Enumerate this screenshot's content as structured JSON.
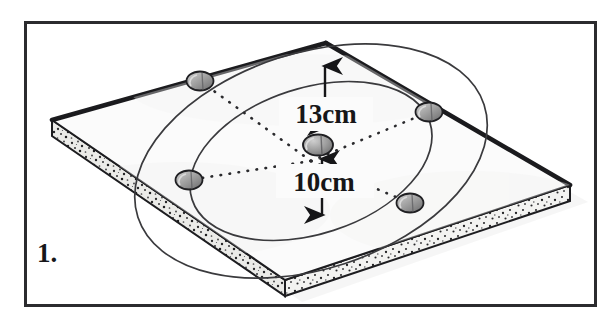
{
  "figure": {
    "kind": "isometric-board-diagram",
    "question_number": "1.",
    "caption_position": "bottom-left",
    "object": "square particle board with two concentric circles and five pegs",
    "frame": {
      "present": true,
      "color": "#2b2b2e",
      "stroke_px": 3
    },
    "dimensions": [
      {
        "name": "outer-radius",
        "label": "13cm",
        "value": 13,
        "unit": "cm",
        "from": "center-peg",
        "to": "outer-circle-top",
        "direction": "up"
      },
      {
        "name": "inner-radius",
        "label": "10cm",
        "value": 10,
        "unit": "cm",
        "from": "center-peg",
        "to": "inner-circle-bottom",
        "direction": "down"
      }
    ],
    "circles": [
      {
        "name": "outer-circle",
        "style": "solid-thin",
        "carries_pegs": true
      },
      {
        "name": "inner-circle",
        "style": "solid-thin",
        "carries_pegs": false
      }
    ],
    "pegs": [
      {
        "name": "peg-center",
        "position": "center"
      },
      {
        "name": "peg-top-left",
        "position": "outer-circle-upper-left"
      },
      {
        "name": "peg-top-right",
        "position": "outer-circle-upper-right"
      },
      {
        "name": "peg-bottom-left",
        "position": "outer-circle-lower-left"
      },
      {
        "name": "peg-bottom-right",
        "position": "outer-circle-lower-right"
      }
    ],
    "radial_lines": {
      "name": "dotted-radii",
      "count": 4,
      "style": "dotted"
    },
    "colors": {
      "ink": "#1d1d20",
      "board_face": "#fbfbfb",
      "board_edge_fill": "#e8e8e6",
      "peg_fill": "#9a9a9a",
      "peg_highlight": "#c9c9c9",
      "shadow": "#ededed",
      "frame": "#2b2b2e"
    }
  }
}
